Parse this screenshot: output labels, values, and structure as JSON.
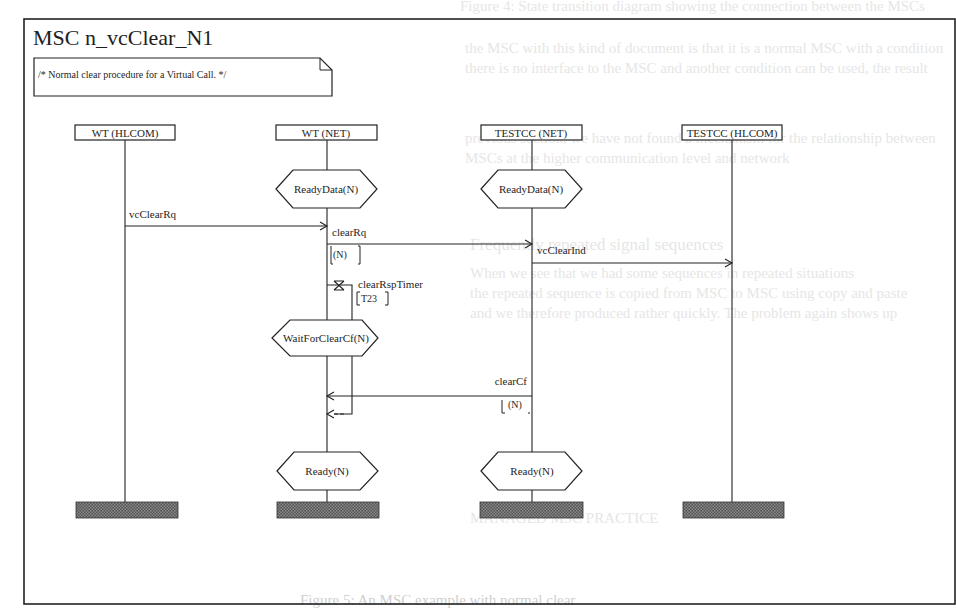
{
  "background_text": {
    "top": "Figure 4: State transition diagram showing the connection between the MSCs",
    "lines": [
      "the MSC with this kind of document is that it is a normal MSC with a condition",
      "there is no interface to the MSC and another condition can be used, the result",
      "another problem related to showing the connection between MSCs",
      "previous section, we have not found a mechanism for the relationship between",
      "MSCs at the higher communication level and network",
      "Frequently repeated signal sequences",
      "When we see that we had some sequences in repeated situations",
      "the repeated sequence is copied from MSC to MSC using copy and paste",
      "and we therefore produced rather quickly. The problem again shows up",
      "the change in this sequence",
      "MANAGED MSC PRACTICE"
    ],
    "caption": "Figure 5: An MSC example with normal clear"
  },
  "msc": {
    "title": "MSC n_vcClear_N1",
    "comment": "/* Normal clear procedure for a Virtual Call. */",
    "instances": [
      {
        "name": "WT (HLCOM)"
      },
      {
        "name": "WT (NET)"
      },
      {
        "name": "TESTCC (NET)"
      },
      {
        "name": "TESTCC (HLCOM)"
      }
    ],
    "conditions": [
      {
        "label": "ReadyData(N)",
        "instance": "WT (NET)"
      },
      {
        "label": "ReadyData(N)",
        "instance": "TESTCC (NET)"
      },
      {
        "label": "WaitForClearCf(N)",
        "instance": "WT (NET)"
      },
      {
        "label": "Ready(N)",
        "instance": "WT (NET)"
      },
      {
        "label": "Ready(N)",
        "instance": "TESTCC (NET)"
      }
    ],
    "messages": [
      {
        "label": "vcClearRq",
        "from": "WT (HLCOM)",
        "to": "WT (NET)"
      },
      {
        "label": "clearRq",
        "param": "(N)",
        "from": "WT (NET)",
        "to": "TESTCC (NET)"
      },
      {
        "label": "vcClearInd",
        "from": "TESTCC (NET)",
        "to": "TESTCC (HLCOM)"
      },
      {
        "label": "clearCf",
        "param": "(N)",
        "from": "TESTCC (NET)",
        "to": "WT (NET)"
      }
    ],
    "timer": {
      "label": "clearRspTimer",
      "value": "[T23]",
      "instance": "WT (NET)"
    }
  }
}
